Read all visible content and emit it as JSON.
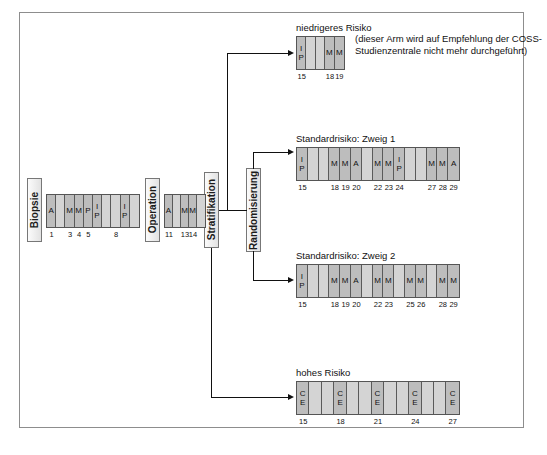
{
  "diagram": {
    "stage_boxes": [
      {
        "id": "biopsie",
        "label": "Biopsie"
      },
      {
        "id": "operation",
        "label": "Operation"
      },
      {
        "id": "stratifikation",
        "label": "Stratifikation"
      },
      {
        "id": "randomisierung",
        "label": "Randomisierung"
      }
    ],
    "branch_titles": {
      "low_risk": "niedrigeres Risiko",
      "standard_1": "Standardrisiko: Zweig 1",
      "standard_2": "Standardrisiko: Zweig 2",
      "high_risk": "hohes Risiko"
    },
    "low_risk_note": "(dieser Arm wird auf Empfehlung der COSS-Studienzentrale nicht mehr durchgeführt)",
    "drug_legend": {
      "A": "A",
      "M": "M",
      "P": "P",
      "I": "I",
      "C": "C",
      "E": "E"
    },
    "blocks": {
      "preop": {
        "name": "praeoperative-chemotherapie",
        "cells": [
          {
            "top": "",
            "bottom": "A",
            "filled": true
          },
          {
            "top": "",
            "bottom": "",
            "filled": false
          },
          {
            "top": "",
            "bottom": "M",
            "filled": true
          },
          {
            "top": "",
            "bottom": "M",
            "filled": true
          },
          {
            "top": "",
            "bottom": "P",
            "filled": true
          },
          {
            "top": "I",
            "bottom": "P",
            "filled": true
          },
          {
            "top": "",
            "bottom": "",
            "filled": false
          },
          {
            "top": "",
            "bottom": "",
            "filled": false
          },
          {
            "top": "I",
            "bottom": "P",
            "filled": true
          },
          {
            "top": "",
            "bottom": "",
            "filled": false
          }
        ],
        "weeks": [
          {
            "label": "1",
            "cell": 0
          },
          {
            "label": "3",
            "cell": 2
          },
          {
            "label": "4",
            "cell": 3
          },
          {
            "label": "5",
            "cell": 4
          },
          {
            "label": "8",
            "cell": 7
          }
        ]
      },
      "postop": {
        "name": "postoperative-chemotherapie",
        "cells": [
          {
            "top": "",
            "bottom": "A",
            "filled": true
          },
          {
            "top": "",
            "bottom": "",
            "filled": false
          },
          {
            "top": "",
            "bottom": "M",
            "filled": true
          },
          {
            "top": "",
            "bottom": "M",
            "filled": true
          },
          {
            "top": "",
            "bottom": "",
            "filled": false
          }
        ],
        "weeks": [
          {
            "label": "11",
            "cell": 0
          },
          {
            "label": "13",
            "cell": 2
          },
          {
            "label": "14",
            "cell": 3
          }
        ]
      },
      "low_risk": {
        "name": "niedrigeres-risiko-arm",
        "cells": [
          {
            "top": "I",
            "bottom": "P",
            "filled": true
          },
          {
            "top": "",
            "bottom": "",
            "filled": false
          },
          {
            "top": "",
            "bottom": "",
            "filled": false
          },
          {
            "top": "",
            "bottom": "M",
            "filled": true
          },
          {
            "top": "",
            "bottom": "M",
            "filled": true
          }
        ],
        "weeks": [
          {
            "label": "15",
            "cell": 0
          },
          {
            "label": "18",
            "cell": 3
          },
          {
            "label": "19",
            "cell": 4
          }
        ]
      },
      "standard_1": {
        "name": "standardrisiko-zweig-1-arm",
        "cells": [
          {
            "top": "I",
            "bottom": "P",
            "filled": true
          },
          {
            "top": "",
            "bottom": "",
            "filled": false
          },
          {
            "top": "",
            "bottom": "",
            "filled": false
          },
          {
            "top": "",
            "bottom": "M",
            "filled": true
          },
          {
            "top": "",
            "bottom": "M",
            "filled": true
          },
          {
            "top": "",
            "bottom": "A",
            "filled": true
          },
          {
            "top": "",
            "bottom": "",
            "filled": false
          },
          {
            "top": "",
            "bottom": "M",
            "filled": true
          },
          {
            "top": "",
            "bottom": "M",
            "filled": true
          },
          {
            "top": "I",
            "bottom": "P",
            "filled": true
          },
          {
            "top": "",
            "bottom": "",
            "filled": false
          },
          {
            "top": "",
            "bottom": "",
            "filled": false
          },
          {
            "top": "",
            "bottom": "M",
            "filled": true
          },
          {
            "top": "",
            "bottom": "M",
            "filled": true
          },
          {
            "top": "",
            "bottom": "A",
            "filled": true
          }
        ],
        "weeks": [
          {
            "label": "15",
            "cell": 0
          },
          {
            "label": "18",
            "cell": 3
          },
          {
            "label": "19",
            "cell": 4
          },
          {
            "label": "20",
            "cell": 5
          },
          {
            "label": "22",
            "cell": 7
          },
          {
            "label": "23",
            "cell": 8
          },
          {
            "label": "24",
            "cell": 9
          },
          {
            "label": "27",
            "cell": 12
          },
          {
            "label": "28",
            "cell": 13
          },
          {
            "label": "29",
            "cell": 14
          }
        ]
      },
      "standard_2": {
        "name": "standardrisiko-zweig-2-arm",
        "cells": [
          {
            "top": "I",
            "bottom": "P",
            "filled": true
          },
          {
            "top": "",
            "bottom": "",
            "filled": false
          },
          {
            "top": "",
            "bottom": "",
            "filled": false
          },
          {
            "top": "",
            "bottom": "M",
            "filled": true
          },
          {
            "top": "",
            "bottom": "M",
            "filled": true
          },
          {
            "top": "",
            "bottom": "A",
            "filled": true
          },
          {
            "top": "",
            "bottom": "",
            "filled": false
          },
          {
            "top": "",
            "bottom": "M",
            "filled": true
          },
          {
            "top": "",
            "bottom": "M",
            "filled": true
          },
          {
            "top": "",
            "bottom": "",
            "filled": false
          },
          {
            "top": "",
            "bottom": "M",
            "filled": true
          },
          {
            "top": "",
            "bottom": "M",
            "filled": true
          },
          {
            "top": "",
            "bottom": "",
            "filled": false
          },
          {
            "top": "",
            "bottom": "M",
            "filled": true
          },
          {
            "top": "",
            "bottom": "M",
            "filled": true
          }
        ],
        "weeks": [
          {
            "label": "15",
            "cell": 0
          },
          {
            "label": "18",
            "cell": 3
          },
          {
            "label": "19",
            "cell": 4
          },
          {
            "label": "20",
            "cell": 5
          },
          {
            "label": "22",
            "cell": 7
          },
          {
            "label": "23",
            "cell": 8
          },
          {
            "label": "25",
            "cell": 10
          },
          {
            "label": "26",
            "cell": 11
          },
          {
            "label": "28",
            "cell": 13
          },
          {
            "label": "29",
            "cell": 14
          }
        ]
      },
      "high_risk": {
        "name": "hohes-risiko-arm",
        "cells": [
          {
            "top": "C",
            "bottom": "E",
            "filled": true
          },
          {
            "top": "",
            "bottom": "",
            "filled": false
          },
          {
            "top": "",
            "bottom": "",
            "filled": false
          },
          {
            "top": "C",
            "bottom": "E",
            "filled": true
          },
          {
            "top": "",
            "bottom": "",
            "filled": false
          },
          {
            "top": "",
            "bottom": "",
            "filled": false
          },
          {
            "top": "C",
            "bottom": "E",
            "filled": true
          },
          {
            "top": "",
            "bottom": "",
            "filled": false
          },
          {
            "top": "",
            "bottom": "",
            "filled": false
          },
          {
            "top": "C",
            "bottom": "E",
            "filled": true
          },
          {
            "top": "",
            "bottom": "",
            "filled": false
          },
          {
            "top": "",
            "bottom": "",
            "filled": false
          },
          {
            "top": "C",
            "bottom": "E",
            "filled": true
          }
        ],
        "weeks": [
          {
            "label": "15",
            "cell": 0
          },
          {
            "label": "18",
            "cell": 3
          },
          {
            "label": "21",
            "cell": 6
          },
          {
            "label": "24",
            "cell": 9
          },
          {
            "label": "27",
            "cell": 12
          }
        ]
      }
    },
    "colors": {
      "frame": "#8d8d8d",
      "cell_fill": "#bdbdbd",
      "cell_empty": "#d4d4d4",
      "line": "#111111",
      "text": "#1b1b1b"
    }
  }
}
